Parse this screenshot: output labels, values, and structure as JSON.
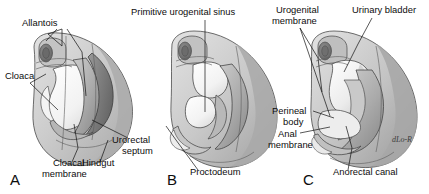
{
  "figure": {
    "type": "embryology-illustration",
    "panel_count": 3,
    "signature": "dLo-R"
  },
  "palette": {
    "background": "#ffffff",
    "ink": "#111111",
    "body_wall_light": "#d6d6d6",
    "body_wall_mid": "#bfbfbf",
    "body_wall_dark": "#9a9a9a",
    "lumen_white": "#fbfbfb",
    "tissue_light": "#e3e3e3",
    "tissue_mid": "#b2b2b2",
    "tissue_dark": "#8a8a8a",
    "tissue_deep": "#6e6e6e",
    "outline": "#3a3a3a"
  },
  "panels": [
    {
      "letter": "A",
      "letter_x": 10,
      "letter_y": 185,
      "labels": [
        {
          "text": "Allantois",
          "x": 22,
          "y": 26,
          "anchor": "start"
        },
        {
          "text": "Cloaca",
          "x": 5,
          "y": 79,
          "anchor": "start"
        },
        {
          "text": "Cloacal",
          "x": 53,
          "y": 166,
          "anchor": "start"
        },
        {
          "text": "membrane",
          "x": 42,
          "y": 177,
          "anchor": "start"
        },
        {
          "text": "Hindgut",
          "x": 82,
          "y": 166,
          "anchor": "start"
        },
        {
          "text": "Urorectal",
          "x": 112,
          "y": 143,
          "anchor": "start"
        },
        {
          "text": "septum",
          "x": 122,
          "y": 154,
          "anchor": "start"
        }
      ]
    },
    {
      "letter": "B",
      "letter_x": 167,
      "letter_y": 185,
      "labels": [
        {
          "text": "Primitive urogenital sinus",
          "x": 131,
          "y": 15,
          "anchor": "start"
        },
        {
          "text": "Proctodeum",
          "x": 190,
          "y": 175,
          "anchor": "start"
        }
      ]
    },
    {
      "letter": "C",
      "letter_x": 303,
      "letter_y": 185,
      "labels": [
        {
          "text": "Urogenital",
          "x": 276,
          "y": 13,
          "anchor": "start"
        },
        {
          "text": "membrane",
          "x": 272,
          "y": 24,
          "anchor": "start"
        },
        {
          "text": "Urinary bladder",
          "x": 352,
          "y": 13,
          "anchor": "start"
        },
        {
          "text": "Perineal",
          "x": 272,
          "y": 114,
          "anchor": "start"
        },
        {
          "text": "body",
          "x": 283,
          "y": 125,
          "anchor": "start"
        },
        {
          "text": "Anal",
          "x": 278,
          "y": 137,
          "anchor": "start"
        },
        {
          "text": "membrane",
          "x": 268,
          "y": 148,
          "anchor": "start"
        },
        {
          "text": "Anorectal canal",
          "x": 333,
          "y": 175,
          "anchor": "start"
        }
      ]
    }
  ],
  "leader_lines": [
    "M62,29 L62,46",
    "M62,29 L48,34 L62,46",
    "M57,29 L46,41",
    "M67,29 L82,52 L86,96",
    "M30,83 L46,74",
    "M30,83 L58,110",
    "M72,162 L78,148 L74,124",
    "M100,162 L108,140",
    "M128,138 L108,128 L92,120",
    "M205,20 L205,64 L205,112",
    "M198,170 L176,140 L166,126",
    "M300,28 L318,58 L322,92",
    "M300,28 L330,116",
    "M372,18 L358,44 L344,72",
    "M313,111 L334,118",
    "M300,133 L330,127",
    "M348,170 L352,148 L346,126"
  ],
  "structures": {
    "A": {
      "allantois": "allantois duct",
      "cloaca": "cloaca cavity",
      "cloacal_membrane": "cloacal membrane",
      "hindgut": "hindgut",
      "urorectal_septum": "urorectal septum wedge"
    },
    "B": {
      "primitive_urogenital_sinus": "primitive urogenital sinus",
      "proctodeum": "proctodeum pit",
      "urorectal_septum": "descending urorectal septum"
    },
    "C": {
      "urogenital_membrane": "urogenital membrane",
      "urinary_bladder": "urinary bladder",
      "perineal_body": "perineal body",
      "anal_membrane": "anal membrane",
      "anorectal_canal": "anorectal canal"
    }
  }
}
